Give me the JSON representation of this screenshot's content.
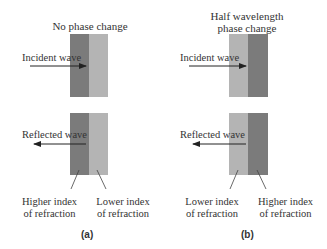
{
  "colors": {
    "higher_index": "#7b7b7b",
    "lower_index": "#b4b4b4",
    "arrow": "#222222",
    "text": "#333333"
  },
  "panels": [
    {
      "id": "a",
      "title": "No phase change",
      "incident_label": "Incident wave",
      "reflected_label": "Reflected wave",
      "left_medium": "Higher index\nof refraction",
      "left_medium_line1": "Higher index",
      "left_medium_line2": "of refraction",
      "right_medium_line1": "Lower index",
      "right_medium_line2": "of refraction",
      "caption": "(a)"
    },
    {
      "id": "b",
      "title_line1": "Half wavelength",
      "title_line2": "phase change",
      "incident_label": "Incident wave",
      "reflected_label": "Reflected wave",
      "left_medium_line1": "Lower index",
      "left_medium_line2": "of refraction",
      "right_medium_line1": "Higher index",
      "right_medium_line2": "of refraction",
      "caption": "(b)"
    }
  ]
}
